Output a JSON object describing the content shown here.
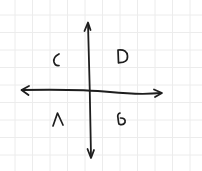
{
  "diagram": {
    "type": "hand-drawn quadrant diagram",
    "background": {
      "color": "#ffffff",
      "grid": {
        "visible": true,
        "color": "#ececec",
        "spacing_px": 17.5,
        "offset_px": 15
      }
    },
    "axes": {
      "color": "#1e1e1e",
      "origin": {
        "x": 91,
        "y": 91
      },
      "vertical": {
        "top_arrow": true,
        "bottom_arrow": true
      },
      "horizontal": {
        "left_arrow": true,
        "right_arrow": true
      }
    },
    "quadrants": [
      {
        "position": "top-left",
        "label": "C"
      },
      {
        "position": "top-right",
        "label": "D"
      },
      {
        "position": "bottom-left",
        "label": "A"
      },
      {
        "position": "bottom-right",
        "label": "B"
      }
    ]
  }
}
